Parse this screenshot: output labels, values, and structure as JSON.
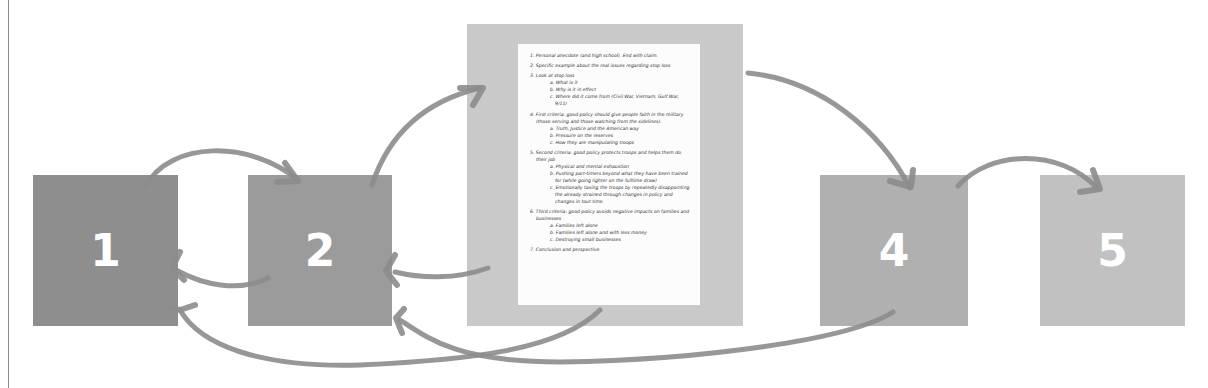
{
  "diagram": {
    "boxes": [
      {
        "id": "1",
        "label": "1",
        "color": "#8e8e8e"
      },
      {
        "id": "2",
        "label": "2",
        "color": "#9b9b9b"
      },
      {
        "id": "3",
        "label": "",
        "color": "#c9c9c9",
        "content": "outline-document"
      },
      {
        "id": "4",
        "label": "4",
        "color": "#b0b0b0"
      },
      {
        "id": "5",
        "label": "5",
        "color": "#c1c1c1"
      }
    ],
    "arrow_color": "#8c8c8c",
    "arrows": [
      {
        "from": "1",
        "to": "2"
      },
      {
        "from": "2",
        "to": "1"
      },
      {
        "from": "2",
        "to": "3"
      },
      {
        "from": "3",
        "to": "2"
      },
      {
        "from": "3",
        "to": "1"
      },
      {
        "from": "3",
        "to": "4"
      },
      {
        "from": "4",
        "to": "5"
      },
      {
        "from": "4",
        "to": "2"
      }
    ]
  },
  "document": {
    "items": [
      {
        "text": "1. Personal anecdote (and high school). End with claim.",
        "sub": []
      },
      {
        "text": "2. Specific example about the real issues regarding stop loss",
        "sub": []
      },
      {
        "text": "3. Look at stop loss",
        "sub": [
          "a. What is it",
          "b. Why is it in effect",
          "c. Where did it come from (Civil War, Vietnam, Gulf War, 9/11)"
        ]
      },
      {
        "text": "4. First criteria: good policy should give people faith in the military (those serving and those watching from the sidelines).",
        "sub": [
          "a. Truth, Justice and the American way",
          "b. Pressure on the reserves",
          "c. How they are manipulating troops"
        ]
      },
      {
        "text": "5. Second criteria: good policy protects troops and helps them do their job",
        "sub": [
          "a. Physical and mental exhaustion",
          "b. Pushing part-timers beyond what they have been trained for (while going lighter on the fulltime draw)",
          "c. Emotionally taxing the troops by repeatedly disappointing the already strained through changes in policy and changes in tout time."
        ]
      },
      {
        "text": "6. Third criteria: good policy avoids negative impacts on families and businesses",
        "sub": [
          "a. Families left alone",
          "b. Families left alone and with less money",
          "c. Destroying small businesses"
        ]
      },
      {
        "text": "7. Conclusion and perspective",
        "sub": []
      }
    ]
  }
}
